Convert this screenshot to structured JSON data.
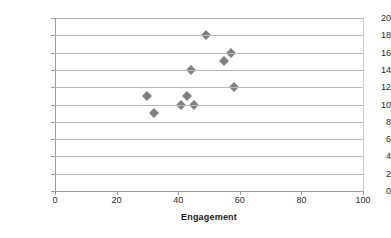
{
  "chart_data": {
    "type": "scatter",
    "title": "",
    "xlabel": "Engagement",
    "ylabel": "Assistance",
    "xlim": [
      0,
      100
    ],
    "ylim": [
      0,
      20
    ],
    "xticks": [
      0,
      20,
      40,
      60,
      80,
      100
    ],
    "yticks": [
      0,
      2,
      4,
      6,
      8,
      10,
      12,
      14,
      16,
      18,
      20
    ],
    "grid": "horizontal",
    "legend": "none",
    "marker": "diamond",
    "marker_color": "#808080",
    "gridline_color": "#b8b8b8",
    "axis_color": "#9a9a9a",
    "series": [
      {
        "name": "",
        "points": [
          {
            "x": 30,
            "y": 11
          },
          {
            "x": 32,
            "y": 9
          },
          {
            "x": 41,
            "y": 10
          },
          {
            "x": 43,
            "y": 11
          },
          {
            "x": 44,
            "y": 14
          },
          {
            "x": 45,
            "y": 10
          },
          {
            "x": 49,
            "y": 18
          },
          {
            "x": 55,
            "y": 15
          },
          {
            "x": 57,
            "y": 16
          },
          {
            "x": 58,
            "y": 12
          }
        ]
      }
    ]
  }
}
